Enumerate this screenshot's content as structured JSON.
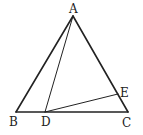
{
  "diagram": {
    "type": "geometry",
    "points": {
      "A": {
        "label": "A",
        "x": 73,
        "y": 16
      },
      "B": {
        "label": "B",
        "x": 16,
        "y": 112
      },
      "C": {
        "label": "C",
        "x": 128,
        "y": 112
      },
      "D": {
        "label": "D",
        "x": 45,
        "y": 112
      },
      "E": {
        "label": "E",
        "x": 118,
        "y": 94
      }
    },
    "segments": [
      "AB",
      "AC",
      "BC",
      "AD",
      "DE"
    ]
  }
}
